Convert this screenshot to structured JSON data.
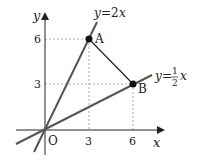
{
  "diagram": {
    "axes": {
      "x_label": "x",
      "y_label": "y",
      "origin_label": "O"
    },
    "x_ticks": [
      "3",
      "6"
    ],
    "y_ticks": [
      "6",
      "3"
    ],
    "lines": [
      {
        "name": "line-y-2x",
        "label": "y=2x",
        "label_lhs": "y",
        "label_eq": "=2",
        "label_var": "x"
      },
      {
        "name": "line-y-half-x",
        "label": "y=1/2x",
        "label_lhs": "y",
        "label_eq": "=",
        "label_num": "1",
        "label_den": "2",
        "label_var": "x"
      }
    ],
    "points": [
      {
        "name": "A",
        "label": "A",
        "x": 3,
        "y": 6
      },
      {
        "name": "B",
        "label": "B",
        "x": 6,
        "y": 3
      }
    ],
    "segments": [
      {
        "from": "A",
        "to": "B"
      }
    ],
    "colors": {
      "axis": "#222222",
      "line": "#555555",
      "dashed": "#999999",
      "point": "#111111"
    }
  }
}
